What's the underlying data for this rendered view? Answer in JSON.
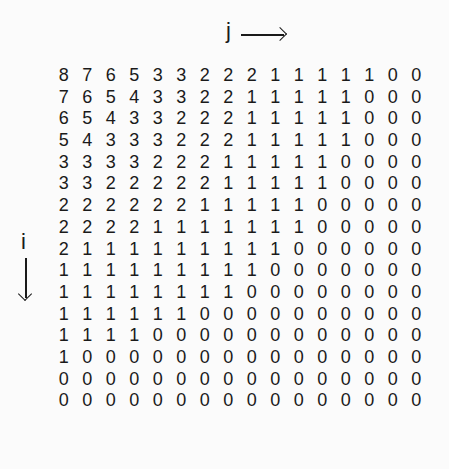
{
  "labels": {
    "column_axis": "j",
    "row_axis": "i"
  },
  "matrix": [
    [
      8,
      7,
      6,
      5,
      3,
      3,
      2,
      2,
      2,
      1,
      1,
      1,
      1,
      1,
      0,
      0
    ],
    [
      7,
      6,
      5,
      4,
      3,
      3,
      2,
      2,
      1,
      1,
      1,
      1,
      1,
      0,
      0,
      0
    ],
    [
      6,
      5,
      4,
      3,
      3,
      2,
      2,
      2,
      1,
      1,
      1,
      1,
      1,
      0,
      0,
      0
    ],
    [
      5,
      4,
      3,
      3,
      3,
      2,
      2,
      2,
      1,
      1,
      1,
      1,
      1,
      0,
      0,
      0
    ],
    [
      3,
      3,
      3,
      3,
      2,
      2,
      2,
      1,
      1,
      1,
      1,
      1,
      0,
      0,
      0,
      0
    ],
    [
      3,
      3,
      2,
      2,
      2,
      2,
      2,
      1,
      1,
      1,
      1,
      1,
      0,
      0,
      0,
      0
    ],
    [
      2,
      2,
      2,
      2,
      2,
      2,
      1,
      1,
      1,
      1,
      1,
      0,
      0,
      0,
      0,
      0
    ],
    [
      2,
      2,
      2,
      2,
      1,
      1,
      1,
      1,
      1,
      1,
      1,
      0,
      0,
      0,
      0,
      0
    ],
    [
      2,
      1,
      1,
      1,
      1,
      1,
      1,
      1,
      1,
      1,
      0,
      0,
      0,
      0,
      0,
      0
    ],
    [
      1,
      1,
      1,
      1,
      1,
      1,
      1,
      1,
      1,
      0,
      0,
      0,
      0,
      0,
      0,
      0
    ],
    [
      1,
      1,
      1,
      1,
      1,
      1,
      1,
      1,
      0,
      0,
      0,
      0,
      0,
      0,
      0,
      0
    ],
    [
      1,
      1,
      1,
      1,
      1,
      1,
      0,
      0,
      0,
      0,
      0,
      0,
      0,
      0,
      0,
      0
    ],
    [
      1,
      1,
      1,
      1,
      0,
      0,
      0,
      0,
      0,
      0,
      0,
      0,
      0,
      0,
      0,
      0
    ],
    [
      1,
      0,
      0,
      0,
      0,
      0,
      0,
      0,
      0,
      0,
      0,
      0,
      0,
      0,
      0,
      0
    ],
    [
      0,
      0,
      0,
      0,
      0,
      0,
      0,
      0,
      0,
      0,
      0,
      0,
      0,
      0,
      0,
      0
    ],
    [
      0,
      0,
      0,
      0,
      0,
      0,
      0,
      0,
      0,
      0,
      0,
      0,
      0,
      0,
      0,
      0
    ]
  ]
}
